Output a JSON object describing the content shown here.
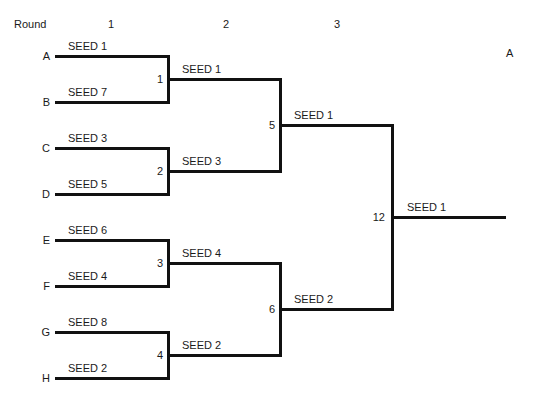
{
  "header": {
    "round_label": "Round",
    "rounds": [
      "1",
      "2",
      "3"
    ],
    "champion_label": "A"
  },
  "round1": {
    "slots": [
      {
        "slot": "A",
        "team": "SEED 1"
      },
      {
        "slot": "B",
        "team": "SEED 7"
      },
      {
        "slot": "C",
        "team": "SEED 3"
      },
      {
        "slot": "D",
        "team": "SEED 5"
      },
      {
        "slot": "E",
        "team": "SEED 6"
      },
      {
        "slot": "F",
        "team": "SEED 4"
      },
      {
        "slot": "G",
        "team": "SEED 8"
      },
      {
        "slot": "H",
        "team": "SEED 2"
      }
    ]
  },
  "round2": {
    "matches": [
      {
        "match": "1",
        "winner": "SEED 1"
      },
      {
        "match": "2",
        "winner": "SEED 3"
      },
      {
        "match": "3",
        "winner": "SEED 4"
      },
      {
        "match": "4",
        "winner": "SEED 2"
      }
    ]
  },
  "round3": {
    "matches": [
      {
        "match": "5",
        "winner": "SEED 1"
      },
      {
        "match": "6",
        "winner": "SEED 2"
      }
    ]
  },
  "final": {
    "match": "12",
    "winner": "SEED 1"
  }
}
